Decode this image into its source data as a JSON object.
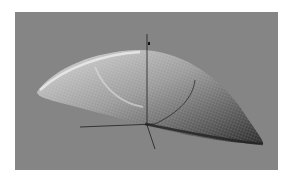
{
  "scene": {
    "description": "3D wireframe shell surface render with coordinate axes",
    "background_color": "#858585",
    "frame_color": "#ffffff",
    "surface_highlight_color": "#e8e8e8",
    "surface_shadow_color": "#2a2a2a",
    "axis_color": "#1e1e1e"
  }
}
